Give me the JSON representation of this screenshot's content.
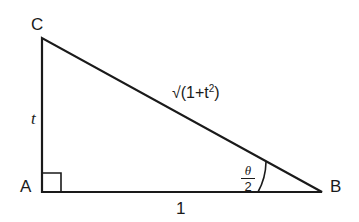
{
  "figure": {
    "vertices": {
      "A": "A",
      "B": "B",
      "C": "C"
    },
    "sides": {
      "AC": "t",
      "AB": "1",
      "BC": {
        "radical": "√",
        "text": "(1+t",
        "sup": "2",
        "close": ")"
      }
    },
    "angle_B": {
      "numerator": "θ",
      "denominator": "2"
    },
    "right_angle_at": "A"
  }
}
